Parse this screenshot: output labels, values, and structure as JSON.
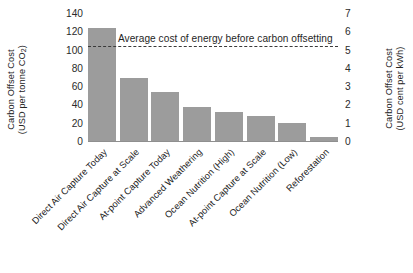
{
  "chart_data": {
    "type": "bar",
    "title": "",
    "subtitle": "",
    "categories": [
      "Direct Air Capture Today",
      "Direct Air Capture at Scale",
      "At-point Capture Today",
      "Advanced Weathering",
      "Ocean Nutrition (High)",
      "At-point Capture at Scale",
      "Ocean Nutrition (Low)",
      "Reforestation"
    ],
    "values": [
      125,
      70,
      55,
      38,
      33,
      28,
      21,
      6
    ],
    "xlabel": "",
    "ylabel": "Carbon Offset Cost (USD per tonne CO2)",
    "ylabel_line1": "Carbon Offset Cost",
    "ylabel_line2_prefix": "(USD per tonne CO",
    "ylabel_line2_sub": "2",
    "ylabel_line2_suffix": ")",
    "ylim": [
      0,
      140
    ],
    "yticks": [
      140,
      120,
      100,
      80,
      60,
      40,
      20,
      0
    ],
    "y2label": "Carbon Offset Cost (USD cent per kWh)",
    "y2label_line1": "Carbon Offset Cost",
    "y2label_line2": "(USD cent per kWh)",
    "y2lim": [
      0,
      7
    ],
    "y2ticks": [
      7,
      6,
      5,
      4,
      3,
      2,
      1,
      0
    ],
    "grid": false,
    "legend": "none",
    "bar_color": "#9c9c9c",
    "annotations": [
      {
        "type": "hline",
        "label": "Average cost of energy before carbon offsetting",
        "value": 105,
        "style": "dashed",
        "color": "#3a3a3a"
      }
    ]
  }
}
